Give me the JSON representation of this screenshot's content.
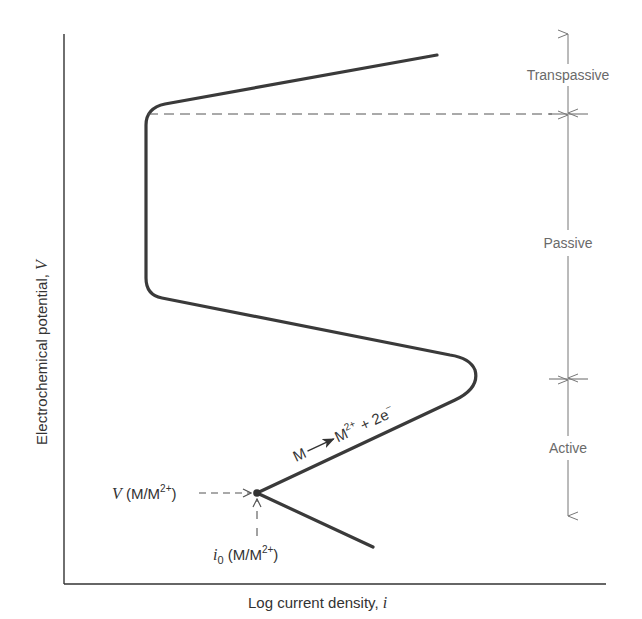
{
  "figure": {
    "type": "polarization-curve"
  },
  "axes": {
    "x_label": "Log current density, ",
    "x_label_var": "i",
    "y_label": "Electrochemical potential, ",
    "y_label_var": "V"
  },
  "regions": [
    {
      "label": "Transpassive"
    },
    {
      "label": "Passive"
    },
    {
      "label": "Active"
    }
  ],
  "annotations": {
    "reaction_lhs": "M",
    "reaction_rhs_base": "M",
    "reaction_rhs_sup": "2+",
    "reaction_plus": " + 2e",
    "reaction_e_sup": "−",
    "equilibrium_potential_var": "V",
    "equilibrium_potential_text": " (M/M",
    "equilibrium_potential_sup": "2+",
    "equilibrium_potential_close": ")",
    "exchange_current_var": "i",
    "exchange_current_sub": "0",
    "exchange_current_text": " (M/M",
    "exchange_current_sup": "2+",
    "exchange_current_close": ")"
  },
  "colors": {
    "curve": "#3a3a3a",
    "axis": "#333333",
    "annotation": "#555555",
    "region_text": "#6a6a6a"
  }
}
